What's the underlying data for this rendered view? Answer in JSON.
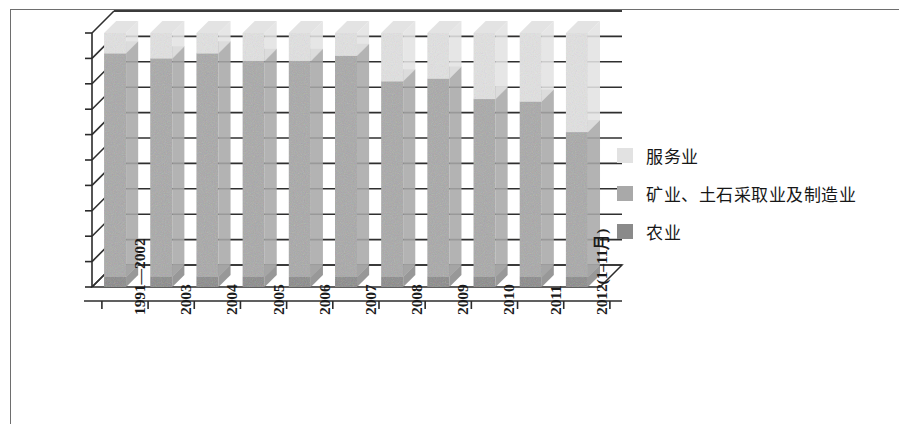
{
  "chart_data": {
    "type": "bar",
    "subtype": "stacked-percentage-3d",
    "title": "",
    "xlabel": "",
    "ylabel": "",
    "ylim": [
      0,
      100
    ],
    "ytick_labels": [
      "100%",
      "90%",
      "80%",
      "70%",
      "60%",
      "50%",
      "40%",
      "30%",
      "20%",
      "10%",
      "0%"
    ],
    "ytick_values": [
      100,
      90,
      80,
      70,
      60,
      50,
      40,
      30,
      20,
      10,
      0
    ],
    "grid": true,
    "legend_position": "right",
    "categories": [
      "1991—2002",
      "2003",
      "2004",
      "2005",
      "2006",
      "2007",
      "2008",
      "2009",
      "2010",
      "2011",
      "2012(1–11月)"
    ],
    "series": [
      {
        "name": "服务业",
        "color": "#e2e2e2",
        "values": [
          8,
          10,
          8,
          11,
          11,
          9,
          19,
          18,
          26,
          27,
          39
        ]
      },
      {
        "name": "矿业、土石采取业及制造业",
        "color": "#a9a9a9",
        "values": [
          88,
          86,
          88,
          85,
          85,
          87,
          77,
          78,
          70,
          69,
          57
        ]
      },
      {
        "name": "农业",
        "color": "#8a8a8a",
        "values": [
          4,
          4,
          4,
          4,
          4,
          4,
          4,
          4,
          4,
          4,
          4
        ]
      }
    ],
    "stack_tops": {
      "agriculture_top": [
        4,
        4,
        4,
        4,
        4,
        4,
        4,
        4,
        4,
        4,
        4
      ],
      "manufacturing_top": [
        92,
        90,
        92,
        89,
        89,
        91,
        81,
        82,
        74,
        73,
        61
      ],
      "services_top": [
        100,
        100,
        100,
        100,
        100,
        100,
        100,
        100,
        100,
        100,
        100
      ]
    }
  },
  "legend": {
    "items": [
      {
        "label": "服务业",
        "color": "#e2e2e2"
      },
      {
        "label": "矿业、土石采取业及制造业",
        "color": "#a9a9a9"
      },
      {
        "label": "农业",
        "color": "#8a8a8a"
      }
    ]
  },
  "colors": {
    "services": "#e2e2e2",
    "manufacturing": "#a9a9a9",
    "agriculture": "#8a8a8a",
    "axis": "#2b2b2b",
    "gridline": "#2f2f2f",
    "page_border": "#6e6e6e",
    "text": "#1b1b1b",
    "wall": "#ffffff",
    "floor": "#ffffff"
  }
}
